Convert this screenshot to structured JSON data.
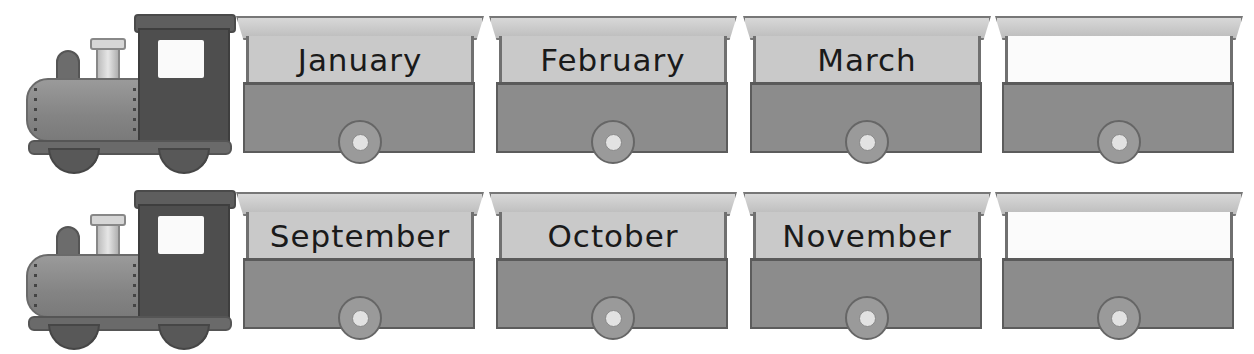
{
  "worksheet": {
    "topic": "Months of the Year Train",
    "colors": {
      "engine_cab": "#4e4e4e",
      "engine_boiler": "#8a8a8a",
      "carriage_body": "#8c8c8c",
      "label_panel": "#c9c9c9",
      "blank_panel": "#fbfbfb",
      "roof": "#cccccc"
    },
    "trains": [
      {
        "engine": {
          "icon": "steam-engine-icon"
        },
        "carriages": [
          {
            "label": "January",
            "blank": false
          },
          {
            "label": "February",
            "blank": false
          },
          {
            "label": "March",
            "blank": false
          },
          {
            "label": "",
            "blank": true
          }
        ]
      },
      {
        "engine": {
          "icon": "steam-engine-icon"
        },
        "carriages": [
          {
            "label": "September",
            "blank": false
          },
          {
            "label": "October",
            "blank": false
          },
          {
            "label": "November",
            "blank": false
          },
          {
            "label": "",
            "blank": true
          }
        ]
      }
    ]
  }
}
